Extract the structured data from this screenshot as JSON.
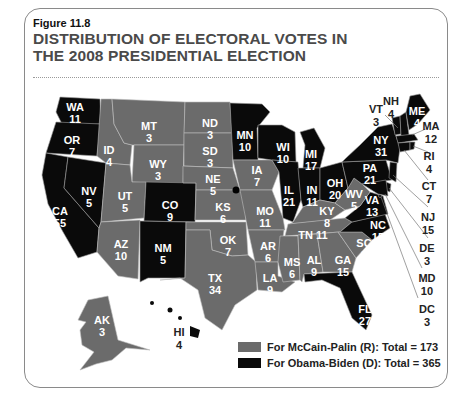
{
  "figure": {
    "label": "Figure 11.8",
    "title_line1": "DISTRIBUTION OF ELECTORAL VOTES IN",
    "title_line2": "THE 2008 PRESIDENTIAL ELECTION"
  },
  "colors": {
    "republican": "#6b6b6b",
    "democrat": "#0a0a0a"
  },
  "legend": {
    "republican": "For McCain-Palin (R): Total = 173",
    "democrat": "For Obama-Biden (D): Total = 365"
  },
  "states": {
    "WA": {
      "abbr": "WA",
      "votes": "11",
      "party": "D"
    },
    "OR": {
      "abbr": "OR",
      "votes": "7",
      "party": "D"
    },
    "CA": {
      "abbr": "CA",
      "votes": "55",
      "party": "D"
    },
    "NV": {
      "abbr": "NV",
      "votes": "5",
      "party": "D"
    },
    "ID": {
      "abbr": "ID",
      "votes": "4",
      "party": "R"
    },
    "MT": {
      "abbr": "MT",
      "votes": "3",
      "party": "R"
    },
    "WY": {
      "abbr": "WY",
      "votes": "3",
      "party": "R"
    },
    "UT": {
      "abbr": "UT",
      "votes": "5",
      "party": "R"
    },
    "AZ": {
      "abbr": "AZ",
      "votes": "10",
      "party": "R"
    },
    "CO": {
      "abbr": "CO",
      "votes": "9",
      "party": "D"
    },
    "NM": {
      "abbr": "NM",
      "votes": "5",
      "party": "D"
    },
    "ND": {
      "abbr": "ND",
      "votes": "3",
      "party": "R"
    },
    "SD": {
      "abbr": "SD",
      "votes": "3",
      "party": "R"
    },
    "NE": {
      "abbr": "NE",
      "votes": "5",
      "party": "R"
    },
    "KS": {
      "abbr": "KS",
      "votes": "6",
      "party": "R"
    },
    "OK": {
      "abbr": "OK",
      "votes": "7",
      "party": "R"
    },
    "TX": {
      "abbr": "TX",
      "votes": "34",
      "party": "R"
    },
    "MN": {
      "abbr": "MN",
      "votes": "10",
      "party": "D"
    },
    "IA": {
      "abbr": "IA",
      "votes": "7",
      "party": "R"
    },
    "MO": {
      "abbr": "MO",
      "votes": "11",
      "party": "R"
    },
    "AR": {
      "abbr": "AR",
      "votes": "6",
      "party": "R"
    },
    "LA": {
      "abbr": "LA",
      "votes": "9",
      "party": "R"
    },
    "WI": {
      "abbr": "WI",
      "votes": "10",
      "party": "D"
    },
    "IL": {
      "abbr": "IL",
      "votes": "21",
      "party": "D"
    },
    "MI": {
      "abbr": "MI",
      "votes": "17",
      "party": "D"
    },
    "IN": {
      "abbr": "IN",
      "votes": "11",
      "party": "D"
    },
    "OH": {
      "abbr": "OH",
      "votes": "20",
      "party": "D"
    },
    "KY": {
      "abbr": "KY",
      "votes": "8",
      "party": "R"
    },
    "TN": {
      "abbr": "TN",
      "votes": "11",
      "party": "R"
    },
    "MS": {
      "abbr": "MS",
      "votes": "6",
      "party": "R"
    },
    "AL": {
      "abbr": "AL",
      "votes": "9",
      "party": "R"
    },
    "GA": {
      "abbr": "GA",
      "votes": "15",
      "party": "R"
    },
    "FL": {
      "abbr": "FL",
      "votes": "27",
      "party": "D"
    },
    "SC": {
      "abbr": "SC",
      "votes": "8",
      "party": "R"
    },
    "NC": {
      "abbr": "NC",
      "votes": "15",
      "party": "D"
    },
    "VA": {
      "abbr": "VA",
      "votes": "13",
      "party": "D"
    },
    "WV": {
      "abbr": "WV",
      "votes": "5",
      "party": "R"
    },
    "PA": {
      "abbr": "PA",
      "votes": "21",
      "party": "D"
    },
    "NY": {
      "abbr": "NY",
      "votes": "31",
      "party": "D"
    },
    "VT": {
      "abbr": "VT",
      "votes": "3",
      "party": "D"
    },
    "NH": {
      "abbr": "NH",
      "votes": "4",
      "party": "D"
    },
    "ME": {
      "abbr": "ME",
      "votes": "4",
      "party": "D"
    },
    "MA": {
      "abbr": "MA",
      "votes": "12",
      "party": "D"
    },
    "RI": {
      "abbr": "RI",
      "votes": "4",
      "party": "D"
    },
    "CT": {
      "abbr": "CT",
      "votes": "7",
      "party": "D"
    },
    "NJ": {
      "abbr": "NJ",
      "votes": "15",
      "party": "D"
    },
    "DE": {
      "abbr": "DE",
      "votes": "3",
      "party": "D"
    },
    "MD": {
      "abbr": "MD",
      "votes": "10",
      "party": "D"
    },
    "DC": {
      "abbr": "DC",
      "votes": "3",
      "party": "D"
    },
    "AK": {
      "abbr": "AK",
      "votes": "3",
      "party": "R"
    },
    "HI": {
      "abbr": "HI",
      "votes": "4",
      "party": "D"
    }
  }
}
